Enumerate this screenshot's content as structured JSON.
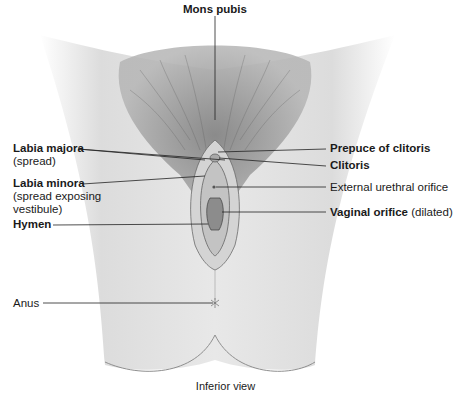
{
  "figure": {
    "view_caption": "Inferior view",
    "labels": {
      "mons_pubis": {
        "title": "Mons pubis"
      },
      "labia_majora": {
        "title": "Labia majora",
        "note": "(spread)"
      },
      "labia_minora": {
        "title": "Labia minora",
        "note_line1": "(spread exposing",
        "note_line2": "vestibule)"
      },
      "hymen": {
        "title": "Hymen"
      },
      "anus": {
        "title": "Anus"
      },
      "prepuce_of_clitoris": {
        "title": "Prepuce of clitoris"
      },
      "clitoris": {
        "title": "Clitoris"
      },
      "external_urethral_orifice": {
        "title": "External urethral orifice"
      },
      "vaginal_orifice": {
        "title": "Vaginal orifice",
        "note": "(dilated)"
      }
    },
    "colors": {
      "background": "#ffffff",
      "skin_light": "#e6e6e6",
      "skin_mid": "#cfcfcf",
      "hair": "#8a8a8a",
      "leader_line": "#222222",
      "text": "#1a1a1a"
    }
  }
}
